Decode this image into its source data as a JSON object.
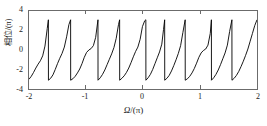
{
  "chart_data": {
    "type": "line",
    "title": "",
    "subtitle": "",
    "xlabel": "Ω/(π)",
    "ylabel": "相位/(π)",
    "xlim": [
      -2,
      2
    ],
    "ylim": [
      -4,
      4
    ],
    "xticks": [
      -2,
      -1,
      0,
      1,
      2
    ],
    "xticklabels": [
      "-2",
      "-1",
      "0",
      "1",
      "2"
    ],
    "yticks": [
      -4,
      -2,
      0,
      2,
      4
    ],
    "yticklabels": [
      "-4",
      "-2",
      "0",
      "2",
      "4"
    ],
    "grid": false,
    "legend": null,
    "legend_position": "none",
    "line_color": "#000000",
    "frame_color": "#6b6b6b",
    "background_color": "#ffffff",
    "wrap_amplitude": 3.14,
    "num_wraps": 9,
    "wrap_x_positions": [
      -1.66,
      -1.27,
      -0.79,
      -0.41,
      0.05,
      0.38,
      0.74,
      1.2,
      1.56
    ],
    "series": [
      {
        "name": "相位",
        "x": [
          -2.0,
          -1.96,
          -1.92,
          -1.88,
          -1.84,
          -1.8,
          -1.76,
          -1.72,
          -1.68,
          -1.66,
          -1.659,
          -1.62,
          -1.58,
          -1.54,
          -1.5,
          -1.46,
          -1.42,
          -1.38,
          -1.34,
          -1.3,
          -1.27,
          -1.269,
          -1.23,
          -1.19,
          -1.15,
          -1.11,
          -1.07,
          -1.03,
          -0.99,
          -0.95,
          -0.91,
          -0.87,
          -0.83,
          -0.79,
          -0.789,
          -0.75,
          -0.71,
          -0.67,
          -0.63,
          -0.59,
          -0.55,
          -0.51,
          -0.47,
          -0.43,
          -0.41,
          -0.409,
          -0.37,
          -0.33,
          -0.29,
          -0.25,
          -0.21,
          -0.17,
          -0.13,
          -0.09,
          -0.05,
          -0.01,
          0.03,
          0.05,
          0.051,
          0.09,
          0.13,
          0.17,
          0.21,
          0.25,
          0.29,
          0.33,
          0.36,
          0.38,
          0.381,
          0.42,
          0.46,
          0.5,
          0.54,
          0.58,
          0.62,
          0.66,
          0.7,
          0.74,
          0.741,
          0.78,
          0.82,
          0.86,
          0.9,
          0.94,
          0.98,
          1.02,
          1.06,
          1.1,
          1.14,
          1.18,
          1.2,
          1.201,
          1.24,
          1.28,
          1.32,
          1.36,
          1.4,
          1.44,
          1.48,
          1.52,
          1.56,
          1.561,
          1.6,
          1.64,
          1.68,
          1.72,
          1.76,
          1.8,
          1.84,
          1.88,
          1.92,
          1.96,
          2.0
        ],
        "y": [
          -3.0,
          -2.7,
          -2.3,
          -1.85,
          -1.45,
          -1.1,
          -0.6,
          0.4,
          2.2,
          3.1,
          -3.1,
          -2.9,
          -2.55,
          -2.0,
          -1.4,
          -0.85,
          -0.35,
          0.3,
          1.35,
          2.6,
          3.1,
          -3.1,
          -2.95,
          -2.7,
          -2.35,
          -1.95,
          -1.4,
          -0.75,
          -0.25,
          0.0,
          0.15,
          0.45,
          1.3,
          3.1,
          -3.1,
          -2.85,
          -2.5,
          -2.05,
          -1.5,
          -0.95,
          -0.4,
          0.25,
          1.2,
          2.6,
          3.1,
          -3.1,
          -2.9,
          -2.65,
          -2.3,
          -1.85,
          -1.3,
          -0.7,
          -0.15,
          0.3,
          1.1,
          2.4,
          3.0,
          3.1,
          -3.1,
          -2.85,
          -2.5,
          -2.0,
          -1.4,
          -0.8,
          -0.2,
          0.6,
          2.1,
          3.1,
          -3.1,
          -2.9,
          -2.6,
          -2.15,
          -1.6,
          -1.0,
          -0.35,
          0.45,
          1.8,
          3.1,
          -3.1,
          -2.95,
          -2.7,
          -2.35,
          -1.9,
          -1.35,
          -0.75,
          -0.3,
          -0.05,
          0.1,
          0.5,
          1.7,
          3.1,
          -3.1,
          -2.85,
          -2.5,
          -2.05,
          -1.5,
          -0.9,
          -0.3,
          0.5,
          1.9,
          3.1,
          -3.1,
          -2.9,
          -2.6,
          -2.2,
          -1.7,
          -1.15,
          -0.55,
          0.1,
          0.9,
          1.7,
          2.5,
          3.1
        ]
      }
    ]
  },
  "axes": {
    "y_title": "相位/(π)",
    "x_title_symbol": "Ω",
    "x_title_rest": "/(π)",
    "x_ticklabels": [
      "-2",
      "-1",
      "0",
      "1",
      "2"
    ],
    "y_ticklabels": [
      "4",
      "2",
      "0",
      "-2",
      "-4"
    ]
  }
}
